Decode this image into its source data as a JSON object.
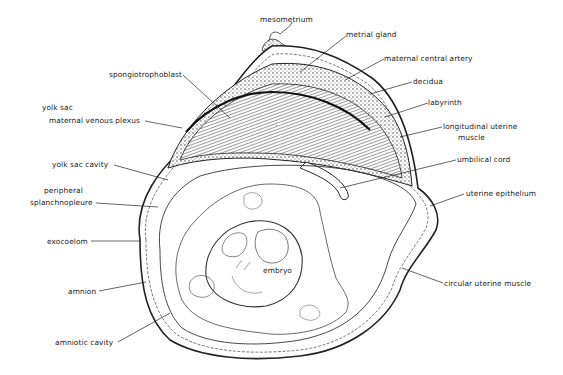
{
  "diagram": {
    "colors": {
      "ink": "#222222",
      "background": "#ffffff",
      "tissue_fill": "#e6e6e6"
    },
    "labels": [
      {
        "id": "mesometrium",
        "text": "mesometrium",
        "x": 260,
        "y": 20,
        "px": 280,
        "py": 35,
        "lx": 280,
        "ly": 29
      },
      {
        "id": "metrial-gland",
        "text": "metrial gland",
        "x": 346,
        "y": 30,
        "px": 300,
        "py": 72,
        "lx": 346,
        "ly": 36
      },
      {
        "id": "maternal-central-artery",
        "text": "maternal central artery",
        "x": 384,
        "y": 54,
        "px": 345,
        "py": 80,
        "lx": 384,
        "ly": 59
      },
      {
        "id": "decidua",
        "text": "decidua",
        "x": 413,
        "y": 77,
        "px": 370,
        "py": 94,
        "lx": 412,
        "ly": 82
      },
      {
        "id": "labyrinth",
        "text": "labyrinth",
        "x": 428,
        "y": 98,
        "px": 385,
        "py": 117,
        "lx": 428,
        "ly": 103
      },
      {
        "id": "longitudinal-uterine-muscle",
        "text": "longitudinal uterine",
        "text2": "muscle",
        "x": 443,
        "y": 122,
        "px": 400,
        "py": 137,
        "lx": 442,
        "ly": 127
      },
      {
        "id": "umbilical-cord",
        "text": "umbilical cord",
        "x": 457,
        "y": 155,
        "px": 340,
        "py": 188,
        "lx": 456,
        "ly": 160
      },
      {
        "id": "uterine-epithelium",
        "text": "uterine epithelium",
        "x": 466,
        "y": 189,
        "px": 430,
        "py": 206,
        "lx": 464,
        "ly": 194
      },
      {
        "id": "circular-uterine-muscle",
        "text": "circular uterine muscle",
        "x": 444,
        "y": 279,
        "px": 402,
        "py": 268,
        "lx": 443,
        "ly": 283
      },
      {
        "id": "spongiotrophoblast",
        "text": "spongiotrophoblast",
        "x": 109,
        "y": 70,
        "px": 230,
        "py": 118,
        "lx": 183,
        "ly": 75
      },
      {
        "id": "yolk-sac",
        "text": "yolk sac",
        "x": 42,
        "y": 103,
        "px": null,
        "py": null,
        "lx": null,
        "ly": null
      },
      {
        "id": "maternal-venous-plexus",
        "text": "maternal venous plexus",
        "x": 49,
        "y": 116,
        "px": 182,
        "py": 128,
        "lx": 145,
        "ly": 121
      },
      {
        "id": "yolk-sac-cavity",
        "text": "yolk sac cavity",
        "x": 52,
        "y": 160,
        "px": 168,
        "py": 180,
        "lx": 114,
        "ly": 165
      },
      {
        "id": "peripheral-splanchnopleure",
        "text": "peripheral",
        "text2": "splanchnopleure",
        "x": 30,
        "y": 188,
        "px": 158,
        "py": 207,
        "lx": 96,
        "ly": 203
      },
      {
        "id": "exocoelom",
        "text": "exocoelom",
        "x": 47,
        "y": 237,
        "px": 140,
        "py": 241,
        "lx": 91,
        "ly": 241
      },
      {
        "id": "amnion",
        "text": "amnion",
        "x": 68,
        "y": 288,
        "px": 146,
        "py": 282,
        "lx": 99,
        "ly": 291
      },
      {
        "id": "amniotic-cavity",
        "text": "amniotic cavity",
        "x": 55,
        "y": 338,
        "px": 170,
        "py": 313,
        "lx": 118,
        "ly": 342
      },
      {
        "id": "embryo",
        "text": "embryo",
        "x": 262,
        "y": 270,
        "px": null,
        "py": null,
        "lx": null,
        "ly": null
      }
    ]
  }
}
